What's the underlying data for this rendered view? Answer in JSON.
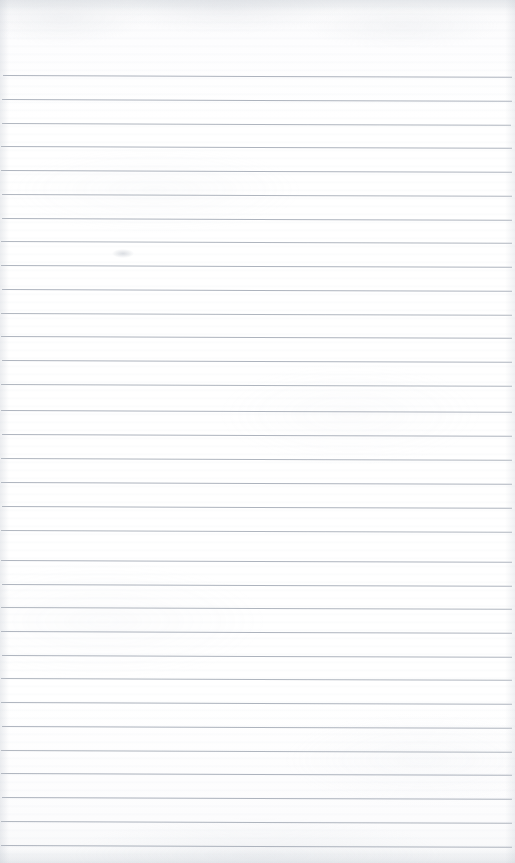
{
  "page": {
    "kind": "lined-notebook-page",
    "width": 515,
    "height": 863,
    "content_text": "",
    "is_blank": true,
    "background_color": "#fdfdfd",
    "rule_color": "#a9afb9",
    "rule_thickness_px": 1,
    "rule_spacing_px": 23.8,
    "first_rule_y_px": 75,
    "rule_count": 33,
    "rule_left_x_px": 2,
    "rule_right_x_px": 512,
    "rule_tilt_deg": 0.2,
    "top_margin_height_px": 75,
    "has_vertical_margin_rule": false,
    "has_header_text": false,
    "has_handwriting": false,
    "has_page_number": false
  },
  "rules": [
    {
      "y": 75,
      "left": 3,
      "right": 512,
      "opacity": 0.95
    },
    {
      "y": 99,
      "left": 2,
      "right": 512,
      "opacity": 0.95
    },
    {
      "y": 123,
      "left": 2,
      "right": 511,
      "opacity": 0.93
    },
    {
      "y": 146,
      "left": 1,
      "right": 512,
      "opacity": 0.95
    },
    {
      "y": 170,
      "left": 1,
      "right": 512,
      "opacity": 0.95
    },
    {
      "y": 194,
      "left": 2,
      "right": 512,
      "opacity": 0.93
    },
    {
      "y": 218,
      "left": 2,
      "right": 512,
      "opacity": 0.95
    },
    {
      "y": 241,
      "left": 1,
      "right": 512,
      "opacity": 0.93
    },
    {
      "y": 265,
      "left": 1,
      "right": 512,
      "opacity": 0.95
    },
    {
      "y": 289,
      "left": 2,
      "right": 512,
      "opacity": 0.95
    },
    {
      "y": 313,
      "left": 1,
      "right": 512,
      "opacity": 0.93
    },
    {
      "y": 336,
      "left": 1,
      "right": 512,
      "opacity": 0.95
    },
    {
      "y": 360,
      "left": 2,
      "right": 512,
      "opacity": 0.95
    },
    {
      "y": 384,
      "left": 1,
      "right": 512,
      "opacity": 0.93
    },
    {
      "y": 410,
      "left": 1,
      "right": 512,
      "opacity": 0.95
    },
    {
      "y": 434,
      "left": 2,
      "right": 512,
      "opacity": 0.95
    },
    {
      "y": 458,
      "left": 1,
      "right": 512,
      "opacity": 0.93
    },
    {
      "y": 482,
      "left": 1,
      "right": 512,
      "opacity": 0.95
    },
    {
      "y": 506,
      "left": 2,
      "right": 512,
      "opacity": 0.95
    },
    {
      "y": 530,
      "left": 1,
      "right": 512,
      "opacity": 0.93
    },
    {
      "y": 560,
      "left": 1,
      "right": 512,
      "opacity": 0.95
    },
    {
      "y": 584,
      "left": 2,
      "right": 512,
      "opacity": 0.95
    },
    {
      "y": 607,
      "left": 1,
      "right": 512,
      "opacity": 0.93
    },
    {
      "y": 631,
      "left": 1,
      "right": 512,
      "opacity": 0.95
    },
    {
      "y": 655,
      "left": 2,
      "right": 512,
      "opacity": 0.95
    },
    {
      "y": 678,
      "left": 1,
      "right": 512,
      "opacity": 0.93
    },
    {
      "y": 702,
      "left": 1,
      "right": 512,
      "opacity": 0.95
    },
    {
      "y": 726,
      "left": 2,
      "right": 512,
      "opacity": 0.95
    },
    {
      "y": 750,
      "left": 1,
      "right": 512,
      "opacity": 0.93
    },
    {
      "y": 773,
      "left": 1,
      "right": 512,
      "opacity": 0.95
    },
    {
      "y": 797,
      "left": 2,
      "right": 512,
      "opacity": 0.95
    },
    {
      "y": 821,
      "left": 1,
      "right": 512,
      "opacity": 0.93
    },
    {
      "y": 845,
      "left": 1,
      "right": 512,
      "opacity": 0.95
    }
  ],
  "artifacts": [
    {
      "name": "faint-smudge",
      "x": 112,
      "y": 249,
      "width": 22,
      "height": 9
    }
  ]
}
